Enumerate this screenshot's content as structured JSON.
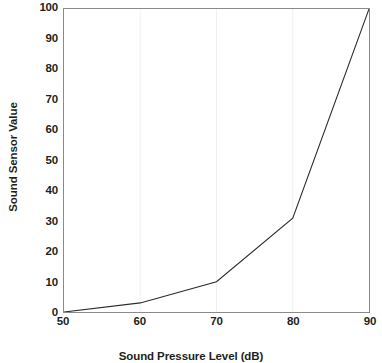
{
  "chart_data": {
    "type": "line",
    "title": "",
    "xlabel": "Sound Pressure Level (dB)",
    "ylabel": "Sound Sensor Value",
    "x": [
      50,
      60,
      70,
      80,
      90
    ],
    "values": [
      0,
      3,
      10,
      31,
      100
    ],
    "series": [
      {
        "name": "Sound Sensor Value",
        "values": [
          0,
          3,
          10,
          31,
          100
        ]
      }
    ],
    "xlim": [
      50,
      90
    ],
    "ylim": [
      0,
      100
    ],
    "xticks": [
      "50",
      "60",
      "70",
      "80",
      "90"
    ],
    "yticks": [
      "0",
      "10",
      "20",
      "30",
      "40",
      "50",
      "60",
      "70",
      "80",
      "90",
      "100"
    ],
    "grid": "vertical-only",
    "legend": "none",
    "line_color": "#2b2b2b",
    "grid_color": "#f0f0f2",
    "border_color": "#8a8a8a",
    "background_color": "#ffffff"
  }
}
